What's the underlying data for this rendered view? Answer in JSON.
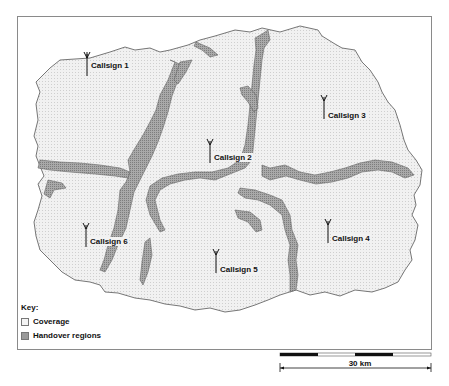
{
  "map": {
    "stations": [
      {
        "label": "Callsign 1",
        "x": 87,
        "y": 65
      },
      {
        "label": "Callsign 2",
        "x": 210,
        "y": 152
      },
      {
        "label": "Callsign 3",
        "x": 324,
        "y": 108
      },
      {
        "label": "Callsign 4",
        "x": 328,
        "y": 232
      },
      {
        "label": "Callsign 5",
        "x": 216,
        "y": 262
      },
      {
        "label": "Callsign 6",
        "x": 86,
        "y": 236
      }
    ],
    "colors": {
      "coverage": "#ececec",
      "handover": "#9a9a9a",
      "outline": "#555555",
      "frame": "#8a8a8a"
    }
  },
  "key": {
    "title": "Key:",
    "items": [
      {
        "label": "Coverage",
        "swatch": "coverage"
      },
      {
        "label": "Handover regions",
        "swatch": "handover"
      }
    ]
  },
  "scale_bar": {
    "label": "30 km"
  }
}
